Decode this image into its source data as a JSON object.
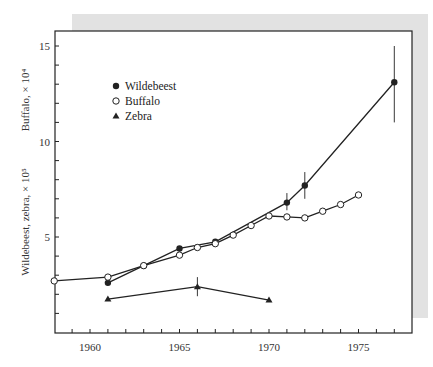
{
  "chart_data": {
    "type": "line",
    "title": "",
    "xlabel": "",
    "ylabel": [
      "Buffalo, × 10⁴",
      "Wildebeest, zebra, × 10⁵"
    ],
    "xlim": [
      1958,
      1978
    ],
    "ylim": [
      0,
      16
    ],
    "x_ticks": [
      1960,
      1965,
      1970,
      1975
    ],
    "y_ticks": [
      5,
      10,
      15
    ],
    "grid": false,
    "legend_position": "upper-left inside",
    "series": [
      {
        "name": "Wildebeest",
        "marker": "filled-circle",
        "x": [
          1961,
          1963,
          1965,
          1967,
          1971,
          1972,
          1977
        ],
        "values": [
          2.6,
          3.5,
          4.4,
          4.75,
          6.8,
          7.7,
          13.1
        ],
        "error_bars": [
          {
            "x": 1971,
            "low": 6.4,
            "high": 7.3
          },
          {
            "x": 1972,
            "low": 7.0,
            "high": 8.4
          },
          {
            "x": 1977,
            "low": 11.0,
            "high": 15.0
          }
        ]
      },
      {
        "name": "Buffalo",
        "marker": "open-circle",
        "x": [
          1958,
          1961,
          1963,
          1965,
          1966,
          1967,
          1968,
          1969,
          1970,
          1971,
          1972,
          1973,
          1974,
          1975
        ],
        "values": [
          2.7,
          2.9,
          3.5,
          4.05,
          4.45,
          4.65,
          5.1,
          5.6,
          6.1,
          6.05,
          6.0,
          6.35,
          6.7,
          7.2
        ]
      },
      {
        "name": "Zebra",
        "marker": "filled-triangle",
        "x": [
          1961,
          1966,
          1970
        ],
        "values": [
          1.75,
          2.4,
          1.7
        ],
        "error_bars": [
          {
            "x": 1966,
            "low": 1.9,
            "high": 2.9
          }
        ]
      }
    ]
  },
  "legend": {
    "items": [
      {
        "label": "Wildebeest",
        "marker": "filled-circle"
      },
      {
        "label": "Buffalo",
        "marker": "open-circle"
      },
      {
        "label": "Zebra",
        "marker": "filled-triangle"
      }
    ]
  },
  "axes": {
    "y_title_upper": "Buffalo, × 10⁴",
    "y_title_lower": "Wildebeest, zebra, × 10⁵"
  },
  "colors": {
    "line": "#222222",
    "panel_shadow": "#e2e2e2",
    "background": "#ffffff"
  }
}
